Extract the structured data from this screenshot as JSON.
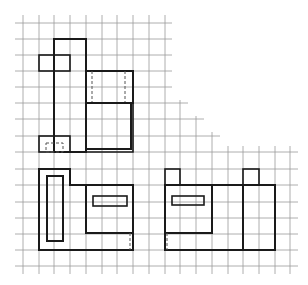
{
  "colors": {
    "background": "#ffffff",
    "grid": "#9a9a9a",
    "outline": "#1a1a1a",
    "hidden_line": "#555555"
  },
  "grid": {
    "cell_size_px": 15.75,
    "columns_x": [
      23,
      39,
      54,
      70,
      86,
      102,
      117,
      133,
      149,
      165,
      180,
      196,
      212,
      228,
      243,
      259,
      275,
      290
    ],
    "rows_y": [
      23,
      39,
      55,
      71,
      87,
      103,
      119,
      136,
      152,
      169,
      185,
      202,
      218,
      234,
      250,
      266
    ],
    "shape": "staircase upper-right cutout"
  },
  "views": [
    {
      "name": "top-view",
      "label": "Top view (upper left)",
      "parts": [
        {
          "name": "tall-stem",
          "type": "rect",
          "x": 54,
          "y": 39,
          "w": 32,
          "h": 113
        },
        {
          "name": "upper-tab",
          "type": "rect",
          "x": 39,
          "y": 55,
          "w": 31,
          "h": 16
        },
        {
          "name": "lower-tab",
          "type": "rect",
          "x": 39,
          "y": 136,
          "w": 31,
          "h": 16
        },
        {
          "name": "lower-tab-hidden",
          "type": "dashed-rect",
          "x": 46,
          "y": 143,
          "w": 17,
          "h": 9
        },
        {
          "name": "upper-block",
          "type": "rect",
          "x": 86,
          "y": 71,
          "w": 47,
          "h": 32
        },
        {
          "name": "upper-block-hidden-left",
          "type": "dashed-line",
          "x1": 92,
          "y1": 71,
          "x2": 92,
          "y2": 103
        },
        {
          "name": "upper-block-hidden-right",
          "type": "dashed-line",
          "x1": 125,
          "y1": 71,
          "x2": 125,
          "y2": 103
        },
        {
          "name": "lower-block",
          "type": "rect",
          "x": 86,
          "y": 103,
          "w": 45,
          "h": 46
        }
      ]
    },
    {
      "name": "front-view",
      "label": "Front view (lower left)",
      "parts": [
        {
          "name": "outer-outline",
          "type": "polygon",
          "points": "39,169 70,169 70,185 133,185 133,250 39,250"
        },
        {
          "name": "vertical-slot",
          "type": "rect",
          "x": 47,
          "y": 176,
          "w": 16,
          "h": 65
        },
        {
          "name": "inner-block",
          "type": "rect",
          "x": 86,
          "y": 185,
          "w": 47,
          "h": 48
        },
        {
          "name": "horizontal-slot",
          "type": "rect",
          "x": 93,
          "y": 196,
          "w": 34,
          "h": 10
        },
        {
          "name": "hidden-edge",
          "type": "dashed-line",
          "x1": 130,
          "y1": 233,
          "x2": 130,
          "y2": 250
        }
      ]
    },
    {
      "name": "side-view",
      "label": "Side view (lower right)",
      "parts": [
        {
          "name": "outer-body",
          "type": "rect",
          "x": 165,
          "y": 185,
          "w": 110,
          "h": 65
        },
        {
          "name": "left-tab",
          "type": "rect",
          "x": 165,
          "y": 169,
          "w": 15,
          "h": 16
        },
        {
          "name": "right-tab",
          "type": "rect",
          "x": 243,
          "y": 169,
          "w": 16,
          "h": 16
        },
        {
          "name": "inner-block",
          "type": "rect",
          "x": 165,
          "y": 185,
          "w": 47,
          "h": 48
        },
        {
          "name": "divider-line",
          "type": "line",
          "x1": 243,
          "y1": 185,
          "x2": 243,
          "y2": 250
        },
        {
          "name": "horizontal-slot",
          "type": "rect",
          "x": 172,
          "y": 196,
          "w": 32,
          "h": 9
        },
        {
          "name": "hidden-edge",
          "type": "dashed-line",
          "x1": 167,
          "y1": 233,
          "x2": 167,
          "y2": 250
        }
      ]
    }
  ]
}
